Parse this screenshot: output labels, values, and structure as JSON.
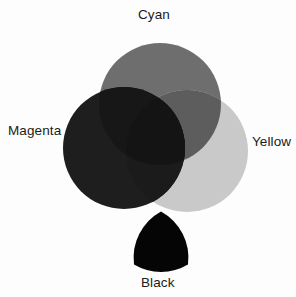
{
  "diagram": {
    "background_color": "#fdfdfd",
    "label_color": "#1b1b1b"
  },
  "labels": {
    "cyan": "Cyan",
    "magenta": "Magenta",
    "yellow": "Yellow",
    "black": "Black"
  },
  "chart_data": {
    "type": "venn",
    "rendering": "grayscale",
    "sets": [
      {
        "name": "Cyan",
        "label": "Cyan",
        "shape": "circle",
        "cx": 160,
        "cy": 104,
        "r": 61,
        "fill": "#6e6e6e",
        "label_position": "top"
      },
      {
        "name": "Magenta",
        "label": "Magenta",
        "shape": "circle",
        "cx": 124,
        "cy": 148,
        "r": 61,
        "fill": "#1e1e1e",
        "label_position": "left"
      },
      {
        "name": "Yellow",
        "label": "Yellow",
        "shape": "circle",
        "cx": 187,
        "cy": 151,
        "r": 61,
        "fill": "#c9c9c9",
        "label_position": "right"
      }
    ],
    "extra_shapes": [
      {
        "name": "Black",
        "label": "Black",
        "shape": "reuleaux-triangle",
        "cx": 161,
        "cy": 238,
        "width": 54,
        "height": 53,
        "fill": "#050505",
        "label_position": "bottom"
      }
    ],
    "overlaps": [
      {
        "sets": [
          "Cyan",
          "Magenta"
        ],
        "fill": "#171717"
      },
      {
        "sets": [
          "Cyan",
          "Yellow"
        ],
        "fill": "#5d5d5d"
      },
      {
        "sets": [
          "Magenta",
          "Yellow"
        ],
        "fill": "#1b1b1b"
      },
      {
        "sets": [
          "Cyan",
          "Magenta",
          "Yellow"
        ],
        "fill": "#141414"
      }
    ],
    "legend": "none",
    "grid": false
  }
}
